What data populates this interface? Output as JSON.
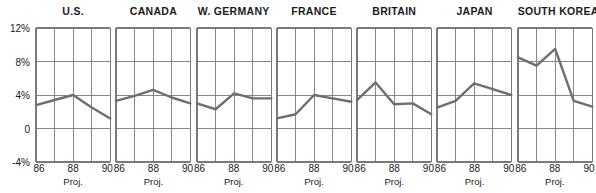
{
  "chart_data": {
    "type": "line",
    "title": "",
    "subtitle": "",
    "xlabel": "Proj.",
    "ylabel": "",
    "ylim": [
      -4,
      12
    ],
    "xlim": [
      86,
      90
    ],
    "grid": true,
    "legend_position": "none",
    "x": [
      86,
      87,
      88,
      89,
      90
    ],
    "x_tick_labels": [
      "86",
      "88",
      "90"
    ],
    "x_tick_values": [
      86,
      88,
      90
    ],
    "y_tick_labels": [
      "12%",
      "8%",
      "4%",
      "0",
      "-4%"
    ],
    "y_tick_values": [
      12,
      8,
      4,
      0,
      -4
    ],
    "annotation": "Proj.",
    "line_color": "#6e6e6e",
    "axis_color": "#1a1a1a",
    "grid_color": "#7a7a7a",
    "panels": [
      {
        "title": "U.S.",
        "values": [
          2.8,
          3.4,
          4.0,
          2.5,
          1.2
        ],
        "xlabels": [
          "86",
          "88",
          "90"
        ],
        "proj": "Proj."
      },
      {
        "title": "CANADA",
        "values": [
          3.3,
          3.9,
          4.6,
          3.7,
          3.0
        ],
        "xlabels": [
          "86",
          "88",
          "90"
        ],
        "proj": "Proj."
      },
      {
        "title": "W. GERMANY",
        "values": [
          3.0,
          2.3,
          4.2,
          3.6,
          3.6
        ],
        "xlabels": [
          "86",
          "88",
          "90"
        ],
        "proj": "Proj."
      },
      {
        "title": "FRANCE",
        "values": [
          1.2,
          1.7,
          4.0,
          3.6,
          3.2
        ],
        "xlabels": [
          "86",
          "88",
          "90"
        ],
        "proj": "Proj."
      },
      {
        "title": "BRITAIN",
        "values": [
          3.4,
          5.5,
          2.9,
          3.0,
          1.7
        ],
        "xlabels": [
          "86",
          "88",
          "90"
        ],
        "proj": "Proj."
      },
      {
        "title": "JAPAN",
        "values": [
          2.5,
          3.3,
          5.4,
          4.7,
          4.0
        ],
        "xlabels": [
          "86",
          "88",
          "90"
        ],
        "proj": "Proj."
      },
      {
        "title": "SOUTH KOREA",
        "values": [
          8.5,
          7.5,
          9.5,
          3.3,
          2.6
        ],
        "xlabels": [
          "86",
          "88",
          "90"
        ],
        "proj": "Proj."
      }
    ]
  }
}
